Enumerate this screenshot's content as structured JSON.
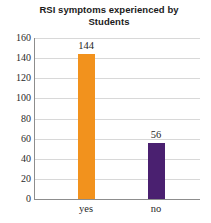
{
  "chart_data": {
    "type": "bar",
    "title": "RSI symptoms experienced by Students",
    "title_line1": "RSI symptoms experienced by",
    "title_line2": "Students",
    "categories": [
      "yes",
      "no"
    ],
    "values": [
      144,
      56
    ],
    "data_labels": [
      "144",
      "56"
    ],
    "colors": [
      "#F2921D",
      "#4A2070"
    ],
    "xlabel": "",
    "ylabel": "",
    "ylim": [
      0,
      160
    ],
    "ytick_step": 20,
    "yticks": [
      "160",
      "140",
      "120",
      "100",
      "80",
      "60",
      "40",
      "20",
      "0"
    ],
    "ytick_values": [
      160,
      140,
      120,
      100,
      80,
      60,
      40,
      20,
      0
    ],
    "grid": true,
    "legend": false,
    "legend_position": "none",
    "axis_color": "#8d8d8d",
    "gridline_color": "#d8d8d8",
    "background": "#ffffff"
  }
}
